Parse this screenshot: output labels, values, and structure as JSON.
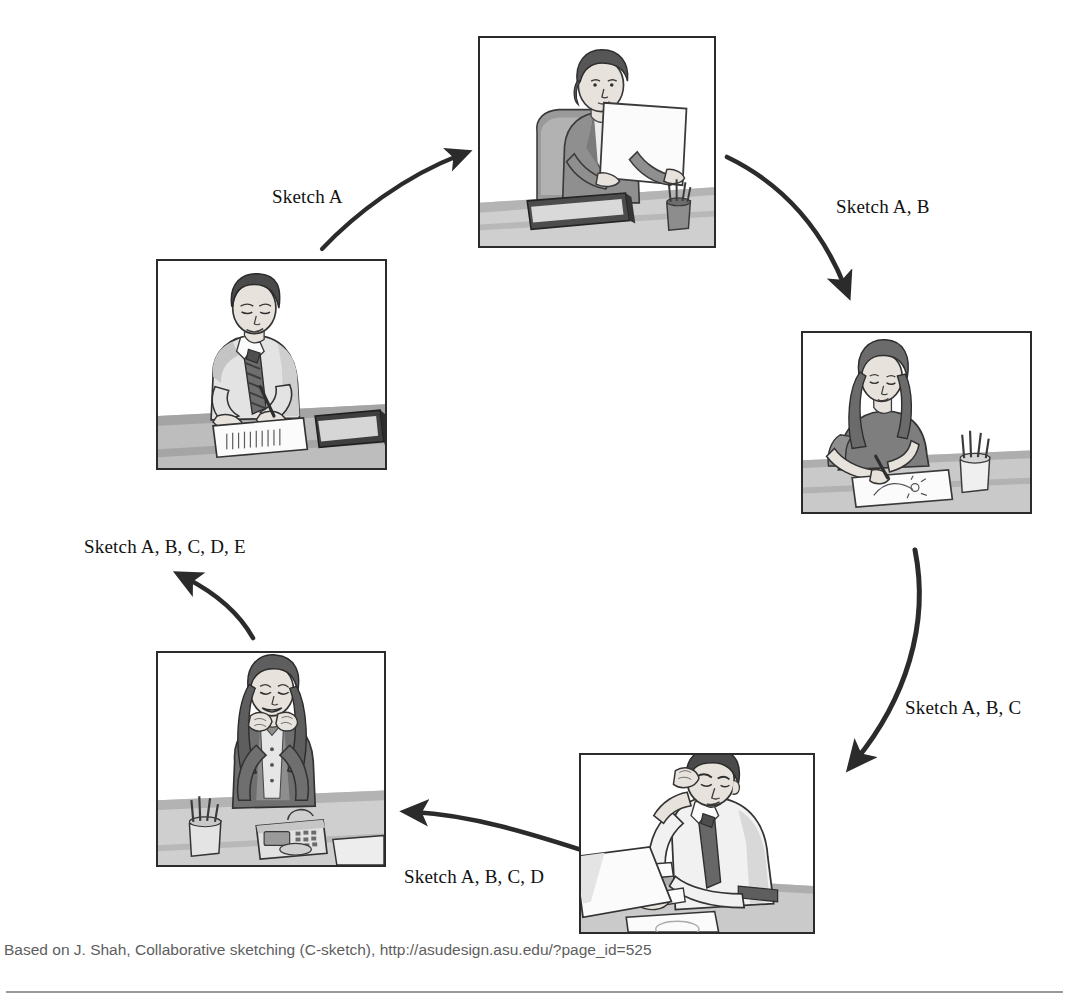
{
  "diagram": {
    "labels": [
      {
        "id": "sketch-a",
        "text": "Sketch A",
        "x": 272,
        "y": 186
      },
      {
        "id": "sketch-a-b",
        "text": "Sketch A, B",
        "x": 836,
        "y": 196
      },
      {
        "id": "sketch-a-b-c",
        "text": "Sketch A, B, C",
        "x": 905,
        "y": 697
      },
      {
        "id": "sketch-a-b-c-d",
        "text": "Sketch A, B, C, D",
        "x": 404,
        "y": 866
      },
      {
        "id": "sketch-a-b-c-d-e",
        "text": "Sketch A, B, C, D, E",
        "x": 84,
        "y": 536
      }
    ],
    "panels": [
      {
        "id": "panel-reviewer-top",
        "alt": "Woman in a suit seated at a desk reading a sheet of paper, notebook and pen cup on desk",
        "x": 478,
        "y": 36,
        "w": 238,
        "h": 212
      },
      {
        "id": "panel-sketcher-right",
        "alt": "Woman with long hair sketching a design on paper at a desk with a pen cup",
        "x": 801,
        "y": 331,
        "w": 231,
        "h": 183
      },
      {
        "id": "panel-thinker-bottom",
        "alt": "Man in shirt and tie resting hand on forehead while studying papers on a desk",
        "x": 579,
        "y": 753,
        "w": 236,
        "h": 181
      },
      {
        "id": "panel-smiling-left-low",
        "alt": "Smiling woman resting chin on hands at a desk with a telephone and pen cup",
        "x": 156,
        "y": 651,
        "w": 230,
        "h": 216
      },
      {
        "id": "panel-writer-left-top",
        "alt": "Man in shirt and tie writing on a sheet of paper at a desk beside a closed book",
        "x": 156,
        "y": 259,
        "w": 231,
        "h": 211
      }
    ],
    "arrows": [
      {
        "id": "arrow-to-top",
        "from": "panel-writer-left-top",
        "to": "panel-reviewer-top",
        "label": "Sketch A"
      },
      {
        "id": "arrow-to-right",
        "from": "panel-reviewer-top",
        "to": "panel-sketcher-right",
        "label": "Sketch A, B"
      },
      {
        "id": "arrow-to-bottom",
        "from": "panel-sketcher-right",
        "to": "panel-thinker-bottom",
        "label": "Sketch A, B, C"
      },
      {
        "id": "arrow-to-left",
        "from": "panel-thinker-bottom",
        "to": "panel-smiling-left-low",
        "label": "Sketch A, B, C, D"
      },
      {
        "id": "arrow-to-up",
        "from": "panel-smiling-left-low",
        "to": "panel-writer-left-top",
        "label": "Sketch A, B, C, D, E"
      }
    ]
  },
  "caption": {
    "text": "Based on J. Shah, Collaborative sketching (C-sketch), http://asudesign.asu.edu/?page_id=525"
  },
  "colors": {
    "ink": "#2b2b2b",
    "caption": "#5e5e5e",
    "rule": "#9a9a9a",
    "skin": "#e8e2dc",
    "skin_shade": "#c9c0b8",
    "mid_gray": "#b9b9b9",
    "dark_gray": "#6f6f6f",
    "light_gray": "#dcdcdc",
    "paper": "#fbfbfb"
  }
}
